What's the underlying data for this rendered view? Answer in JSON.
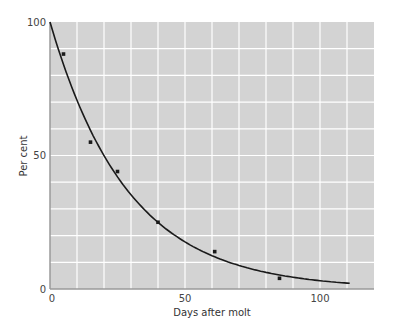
{
  "chart_data": {
    "type": "scatter",
    "title": "",
    "xlabel": "Days after molt",
    "ylabel": "Per cent",
    "xlim": [
      0,
      120
    ],
    "ylim": [
      0,
      100
    ],
    "x_ticks": [
      0,
      50,
      100
    ],
    "y_ticks": [
      0,
      50,
      100
    ],
    "grid": {
      "on": true,
      "x_step": 10,
      "y_step": 10
    },
    "legend": null,
    "series": [
      {
        "name": "observed",
        "kind": "scatter",
        "x": [
          5,
          15,
          25,
          40,
          61,
          85
        ],
        "y": [
          88,
          55,
          44,
          25,
          14,
          4
        ]
      },
      {
        "name": "fitted curve",
        "kind": "line",
        "equation": "y = 100 * exp(-0.0347 * x)",
        "x_range": [
          0,
          111
        ]
      }
    ]
  },
  "colors": {
    "plot_background": "#d3d3d3",
    "grid": "#ffffff",
    "axis": "#9a9a9a",
    "curve": "#1a1a1a",
    "points": "#1a1a1a"
  }
}
